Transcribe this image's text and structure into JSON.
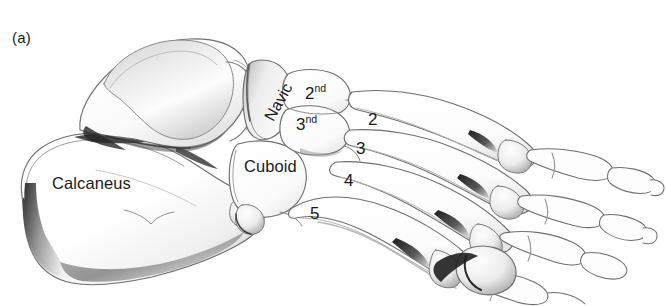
{
  "figure": {
    "panel_id": "(a)",
    "view": "lateral oblique view of foot skeleton",
    "background_color": "#ffffff",
    "ink_color": "#1a1a1a",
    "outline_color": "#6e6e6e",
    "shadow_color": "#3a3a3a"
  },
  "labels": {
    "calcaneus": "Calcaneus",
    "navicular": "Navic",
    "cuboid": "Cuboid",
    "cuneiform_2": "2",
    "cuneiform_2_suffix": "nd",
    "cuneiform_3": "3",
    "cuneiform_3_suffix": "nd",
    "metatarsal_2": "2",
    "metatarsal_3": "3",
    "metatarsal_4": "4",
    "metatarsal_5": "5"
  },
  "label_list": [
    {
      "name": "panel-id",
      "text": "(a)",
      "x": 12,
      "y": 30
    },
    {
      "name": "calcaneus-label",
      "text": "Calcaneus",
      "x": 52,
      "y": 175
    },
    {
      "name": "navicular-label",
      "text": "Navic",
      "x": 262,
      "y": 116
    },
    {
      "name": "cuboid-label",
      "text": "Cuboid",
      "x": 244,
      "y": 158
    },
    {
      "name": "second-cuneiform",
      "text": "2nd",
      "x": 305,
      "y": 83
    },
    {
      "name": "third-cuneiform",
      "text": "3nd",
      "x": 296,
      "y": 114
    },
    {
      "name": "metatarsal-2-label",
      "text": "2",
      "x": 368,
      "y": 111
    },
    {
      "name": "metatarsal-3-label",
      "text": "3",
      "x": 356,
      "y": 140
    },
    {
      "name": "metatarsal-4-label",
      "text": "4",
      "x": 344,
      "y": 172
    },
    {
      "name": "metatarsal-5-label",
      "text": "5",
      "x": 310,
      "y": 205
    }
  ]
}
